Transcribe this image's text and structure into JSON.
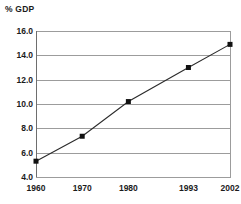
{
  "chart_data": {
    "type": "line",
    "title": "",
    "ylabel": "% GDP",
    "xlabel": "",
    "categories": [
      "1960",
      "1970",
      "1980",
      "1993",
      "2002"
    ],
    "x": [
      1960,
      1970,
      1980,
      1993,
      2002
    ],
    "values": [
      5.3,
      7.35,
      10.2,
      13.0,
      14.9
    ],
    "series": [
      {
        "name": "% GDP",
        "values": [
          5.3,
          7.35,
          10.2,
          13.0,
          14.9
        ]
      }
    ],
    "ylim": [
      4.0,
      16.0
    ],
    "xlim": [
      1960,
      2002
    ],
    "yticks": [
      "16.0",
      "14.0",
      "12.0",
      "10.0",
      "8.0",
      "6.0",
      "4.0"
    ],
    "ytick_values": [
      16.0,
      14.0,
      12.0,
      10.0,
      8.0,
      6.0,
      4.0
    ],
    "xticks": [
      "1960",
      "1970",
      "1980",
      "1993",
      "2002"
    ],
    "grid": "horizontal",
    "legend": "none",
    "marker": "square",
    "colors": {
      "line": "#2b2b2b",
      "marker": "#111111",
      "gridline": "#9c9c9c",
      "text": "#1b1b1b",
      "background": "#ffffff"
    }
  }
}
